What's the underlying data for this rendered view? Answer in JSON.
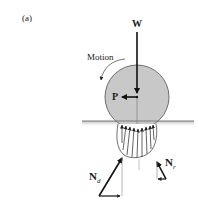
{
  "figure": {
    "panel_label": "(a)",
    "labels": {
      "weight": "W",
      "push": "P",
      "motion": "Motion",
      "normal_d": "N",
      "normal_d_sub": "d",
      "normal_r": "N",
      "normal_r_sub": "r"
    },
    "colors": {
      "wheel_fill": "#c8c8c8",
      "wheel_stroke": "#6e6e6e",
      "ground": "#7a7a7a",
      "arrow": "#111111",
      "thin_arrow": "#333333"
    }
  }
}
